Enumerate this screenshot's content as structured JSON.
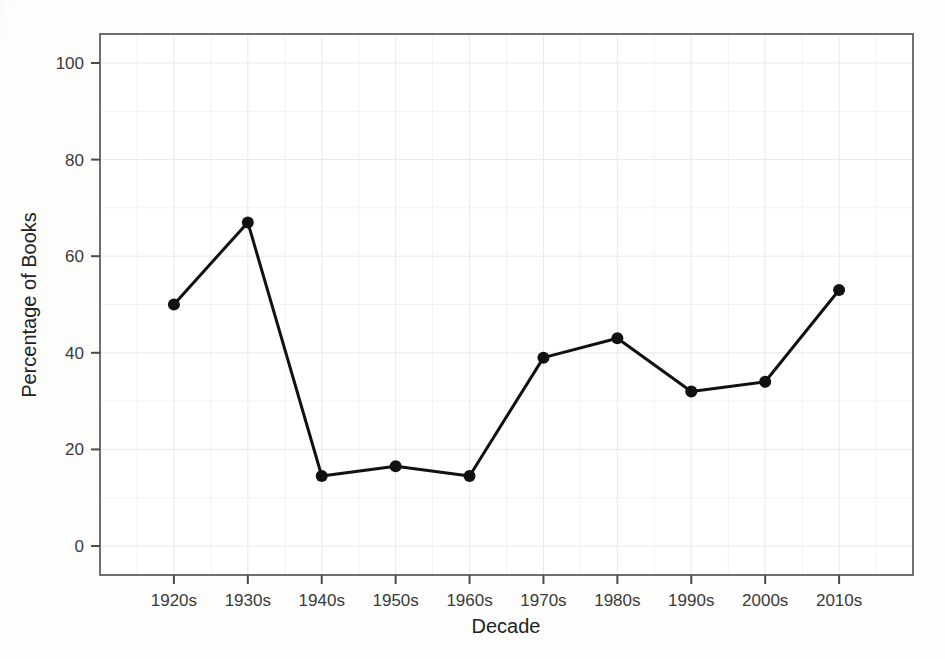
{
  "chart_data": {
    "type": "line",
    "title": "",
    "xlabel": "Decade",
    "ylabel": "Percentage of Books",
    "categories": [
      "1920s",
      "1930s",
      "1940s",
      "1950s",
      "1960s",
      "1970s",
      "1980s",
      "1990s",
      "2000s",
      "2010s"
    ],
    "values": [
      50,
      67,
      14.5,
      16.5,
      14.5,
      39,
      43,
      32,
      34,
      53
    ],
    "series": [
      {
        "name": "Percentage of Books",
        "values": [
          50,
          67,
          14.5,
          16.5,
          14.5,
          39,
          43,
          32,
          34,
          53
        ]
      }
    ],
    "ylim": [
      -6,
      106
    ],
    "yticks": [
      0,
      20,
      40,
      60,
      80,
      100
    ],
    "ytick_labels": [
      "0",
      "20",
      "40",
      "60",
      "80",
      "100"
    ],
    "xtick_labels": [
      "1920s",
      "1930s",
      "1940s",
      "1950s",
      "1960s",
      "1970s",
      "1980s",
      "1990s",
      "2000s",
      "2010s"
    ],
    "grid": true,
    "legend": "none",
    "line_color": "#111111",
    "marker": "circle",
    "marker_color": "#111111",
    "background_color": "#ffffff",
    "grid_color": "#ebebeb"
  },
  "axes": {
    "y_title": "Percentage of Books",
    "x_title": "Decade"
  }
}
